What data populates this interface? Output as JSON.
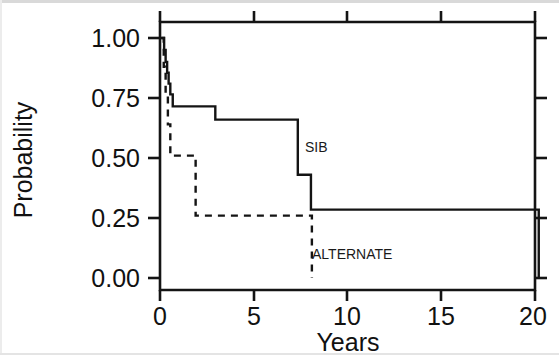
{
  "chart_data": {
    "type": "line",
    "title": "",
    "xlabel": "Years",
    "ylabel": "Probability",
    "xlim": [
      -0.35,
      21.2
    ],
    "ylim": [
      -0.05,
      1.06
    ],
    "xticks": [
      0,
      5,
      10,
      15,
      20
    ],
    "xtick_labels": [
      "0",
      "5",
      "10",
      "15",
      "20"
    ],
    "yticks": [
      0.0,
      0.25,
      0.5,
      0.75,
      1.0
    ],
    "ytick_labels": [
      "0.00",
      "0.25",
      "0.50",
      "0.75",
      "1.00"
    ],
    "grid": false,
    "legend_position": "inline-annotations",
    "series": [
      {
        "name": "SIB",
        "style": "solid",
        "label_text": "SIB",
        "label_x": 8.6,
        "label_y": 0.52,
        "step": "post",
        "points": [
          [
            0.0,
            1.0
          ],
          [
            0.22,
            1.0
          ],
          [
            0.22,
            0.95
          ],
          [
            0.3,
            0.95
          ],
          [
            0.3,
            0.9
          ],
          [
            0.38,
            0.9
          ],
          [
            0.38,
            0.855
          ],
          [
            0.46,
            0.855
          ],
          [
            0.46,
            0.81
          ],
          [
            0.55,
            0.81
          ],
          [
            0.55,
            0.765
          ],
          [
            0.68,
            0.765
          ],
          [
            0.68,
            0.715
          ],
          [
            2.95,
            0.715
          ],
          [
            2.95,
            0.66
          ],
          [
            7.35,
            0.66
          ],
          [
            7.35,
            0.43
          ],
          [
            8.05,
            0.43
          ],
          [
            8.05,
            0.285
          ],
          [
            20.2,
            0.285
          ],
          [
            20.2,
            0.0
          ]
        ]
      },
      {
        "name": "ALTERNATE",
        "style": "dashed",
        "label_text": "ALTERNATE",
        "label_x": 8.65,
        "label_y": 0.1,
        "step": "post",
        "points": [
          [
            0.08,
            1.0
          ],
          [
            0.2,
            1.0
          ],
          [
            0.2,
            0.88
          ],
          [
            0.3,
            0.88
          ],
          [
            0.3,
            0.76
          ],
          [
            0.42,
            0.76
          ],
          [
            0.42,
            0.64
          ],
          [
            0.55,
            0.64
          ],
          [
            0.55,
            0.51
          ],
          [
            1.9,
            0.51
          ],
          [
            1.9,
            0.26
          ],
          [
            8.1,
            0.26
          ],
          [
            8.1,
            0.0
          ]
        ]
      }
    ]
  },
  "axes": {
    "x_axis_title": "Years",
    "y_axis_title": "Probability",
    "x_tick_labels": [
      "0",
      "5",
      "10",
      "15",
      "20"
    ],
    "y_tick_labels": [
      "0.00",
      "0.25",
      "0.50",
      "0.75",
      "1.00"
    ]
  },
  "annotations": {
    "sib_label": "SIB",
    "alternate_label": "ALTERNATE"
  },
  "colors": {
    "ink": "#141414",
    "background": "#ffffff"
  }
}
